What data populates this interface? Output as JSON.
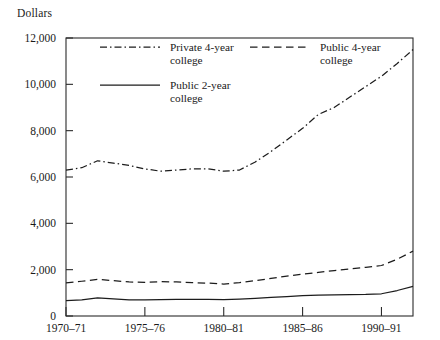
{
  "chart_data": {
    "type": "line",
    "title": "",
    "ylabel": "Dollars",
    "xlabel": "",
    "ylim": [
      0,
      12000
    ],
    "yticks": [
      0,
      2000,
      4000,
      6000,
      8000,
      10000,
      12000
    ],
    "ytick_labels": [
      "0",
      "2,000",
      "4,000",
      "6,000",
      "8,000",
      "10,000",
      "12,000"
    ],
    "grid": false,
    "legend_position": "inside-top-left",
    "x": [
      "1970-71",
      "1971-72",
      "1972-73",
      "1973-74",
      "1974-75",
      "1975-76",
      "1976-77",
      "1977-78",
      "1978-79",
      "1979-80",
      "1980-81",
      "1981-82",
      "1982-83",
      "1983-84",
      "1984-85",
      "1985-86",
      "1986-87",
      "1987-88",
      "1988-89",
      "1989-90",
      "1990-91",
      "1991-92",
      "1992-93"
    ],
    "xtick_labels": [
      "1970–71",
      "1975–76",
      "1980–81",
      "1985–86",
      "1990–91"
    ],
    "xtick_values": [
      "1970-71",
      "1975-76",
      "1980-81",
      "1985-86",
      "1990-91"
    ],
    "series": [
      {
        "name": "Private 4-year college",
        "style": "dash-dot",
        "values": [
          6300,
          6400,
          6700,
          6600,
          6500,
          6350,
          6250,
          6300,
          6350,
          6350,
          6250,
          6300,
          6650,
          7100,
          7600,
          8100,
          8700,
          9000,
          9450,
          9900,
          10350,
          10900,
          11500
        ]
      },
      {
        "name": "Public 4-year college",
        "style": "dashed",
        "values": [
          1430,
          1500,
          1580,
          1530,
          1470,
          1450,
          1480,
          1470,
          1440,
          1420,
          1380,
          1440,
          1530,
          1620,
          1720,
          1810,
          1880,
          1960,
          2030,
          2100,
          2180,
          2450,
          2800
        ]
      },
      {
        "name": "Public 2-year college",
        "style": "solid",
        "values": [
          660,
          700,
          780,
          740,
          700,
          700,
          710,
          720,
          720,
          720,
          710,
          730,
          760,
          800,
          840,
          880,
          900,
          910,
          920,
          930,
          960,
          1100,
          1280
        ]
      }
    ]
  },
  "legend": {
    "entries": [
      {
        "id": "private-4-year",
        "label_line1": "Private 4-year",
        "label_line2": "college",
        "style": "dash-dot"
      },
      {
        "id": "public-4-year",
        "label_line1": "Public 4-year",
        "label_line2": "college",
        "style": "dashed"
      },
      {
        "id": "public-2-year",
        "label_line1": "Public 2-year",
        "label_line2": "college",
        "style": "solid"
      }
    ]
  },
  "colors": {
    "line": "#1c1c1c",
    "axis": "#2b2b2b",
    "text": "#1a1a1a",
    "background": "#ffffff"
  }
}
